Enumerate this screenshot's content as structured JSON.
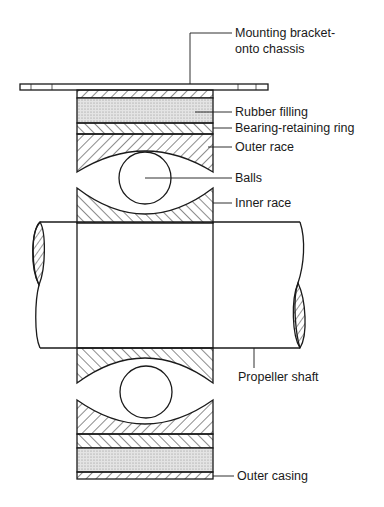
{
  "diagram": {
    "labels": {
      "bracket_line1": "Mounting bracket-",
      "bracket_line2": "onto chassis",
      "rubber": "Rubber filling",
      "retaining_ring": "Bearing-retaining ring",
      "outer_race": "Outer race",
      "balls": "Balls",
      "inner_race": "Inner race",
      "shaft": "Propeller shaft",
      "casing": "Outer casing"
    },
    "colors": {
      "line": "#1a1a1a",
      "rubber_fill": "#dcdcdc",
      "background": "#ffffff"
    }
  }
}
